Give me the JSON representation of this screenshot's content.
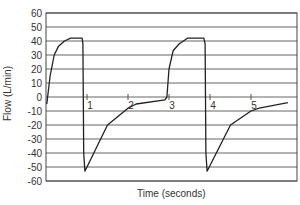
{
  "chart_data": {
    "type": "line",
    "title": "",
    "xlabel": "Time (seconds)",
    "ylabel": "Flow (L/min)",
    "xlim": [
      0,
      6.1
    ],
    "ylim": [
      -60,
      60
    ],
    "grid": {
      "horizontal": true,
      "vertical": false
    },
    "legend": null,
    "y_ticks": [
      60,
      50,
      40,
      30,
      20,
      10,
      0,
      -10,
      -20,
      -30,
      -40,
      -50,
      -60
    ],
    "x_ticks": [
      1,
      2,
      3,
      4,
      5
    ],
    "series": [
      {
        "name": "Flow",
        "color": "#222222",
        "x": [
          0.02,
          0.1,
          0.2,
          0.3,
          0.45,
          0.6,
          0.88,
          0.9,
          0.91,
          0.92,
          0.95,
          1.5,
          2.0,
          2.2,
          2.9,
          2.95,
          3.0,
          3.1,
          3.25,
          3.45,
          3.85,
          3.88,
          3.89,
          3.9,
          3.93,
          4.5,
          5.0,
          5.2,
          5.9
        ],
        "y": [
          -5,
          15,
          30,
          36,
          40,
          42,
          42,
          38,
          0,
          -40,
          -53,
          -20,
          -8,
          -5,
          -2,
          0,
          20,
          33,
          38,
          42,
          42,
          38,
          0,
          -40,
          -53,
          -20,
          -10,
          -8,
          -4
        ]
      }
    ]
  },
  "axes": {
    "x_label": "Time (seconds)",
    "y_label": "Flow (L/min)",
    "y_tick_labels": [
      "60",
      "50",
      "40",
      "30",
      "20",
      "10",
      "0",
      "-10",
      "-20",
      "-30",
      "-40",
      "-50",
      "-60"
    ],
    "x_tick_labels": [
      "1",
      "2",
      "3",
      "4",
      "5"
    ]
  }
}
